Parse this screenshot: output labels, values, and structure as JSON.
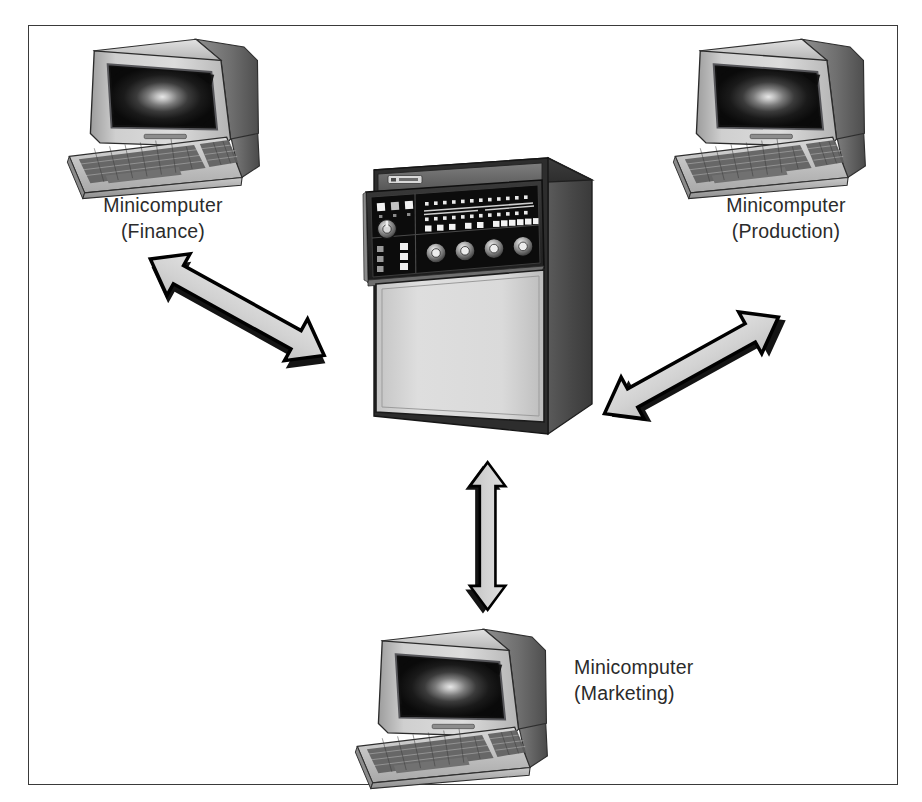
{
  "figure": {
    "kind": "network-topology-diagram",
    "background_color": "#ffffff",
    "frame_color": "#3a3a3a",
    "arrow_fill": "#d4d4d4",
    "arrow_outline": "#000000",
    "arrow_shadow": "#000000"
  },
  "nodes": {
    "finance": {
      "label_line1": "Minicomputer",
      "label_line2": "(Finance)",
      "device": "crt-terminal",
      "position": "top-left"
    },
    "production": {
      "label_line1": "Minicomputer",
      "label_line2": "(Production)",
      "device": "crt-terminal",
      "position": "top-right"
    },
    "marketing": {
      "label_line1": "Minicomputer",
      "label_line2": "(Marketing)",
      "device": "crt-terminal",
      "position": "bottom-center"
    },
    "mainframe": {
      "label_line1": "",
      "label_line2": "",
      "device": "mainframe-cabinet",
      "position": "center"
    }
  },
  "connections": [
    {
      "id": "finance-mainframe",
      "from": "finance",
      "to": "mainframe",
      "style": "double-headed-arrow",
      "direction": "diagonal-down-right"
    },
    {
      "id": "production-mainframe",
      "from": "production",
      "to": "mainframe",
      "style": "double-headed-arrow",
      "direction": "diagonal-down-left"
    },
    {
      "id": "marketing-mainframe",
      "from": "marketing",
      "to": "mainframe",
      "style": "double-headed-arrow",
      "direction": "vertical"
    }
  ],
  "mainframe_panel": {
    "indicator_rows": 2,
    "lamp_count_per_row": 16,
    "toggle_switch_count": 13,
    "rotary_dial_count": 4,
    "selector_knob_count": 1,
    "left_button_count": 3,
    "badge_text": ""
  }
}
